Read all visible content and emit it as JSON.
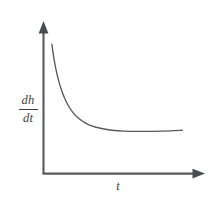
{
  "figure": {
    "background_color": "#ffffff",
    "ink_color": "#58595b",
    "label_color": "#3f4042"
  },
  "axes": {
    "y_axis": {
      "label_numerator": "dh",
      "label_denominator": "dt",
      "label_plain": "dh/dt",
      "has_arrowhead": true,
      "tick_labels": []
    },
    "x_axis": {
      "label": "t",
      "has_arrowhead": true,
      "tick_labels": []
    }
  },
  "chart_data": {
    "type": "line",
    "title": "",
    "subtitle": "",
    "xlabel": "t",
    "ylabel": "dh/dt",
    "grid": false,
    "legend": null,
    "legend_position": "none",
    "xlim": [
      0,
      1
    ],
    "ylim": [
      0,
      1
    ],
    "x_tick_labels": [],
    "y_tick_labels": [],
    "annotations": [],
    "series": [
      {
        "name": "dh/dt",
        "color": "#58595b",
        "x": [
          0.055,
          0.062,
          0.072,
          0.085,
          0.1,
          0.118,
          0.14,
          0.165,
          0.195,
          0.23,
          0.27,
          0.32,
          0.38,
          0.45,
          0.53,
          0.62,
          0.72,
          0.83,
          0.91
        ],
        "y": [
          0.895,
          0.84,
          0.775,
          0.705,
          0.64,
          0.578,
          0.518,
          0.466,
          0.42,
          0.382,
          0.352,
          0.328,
          0.312,
          0.3,
          0.294,
          0.292,
          0.292,
          0.295,
          0.3
        ]
      }
    ]
  }
}
